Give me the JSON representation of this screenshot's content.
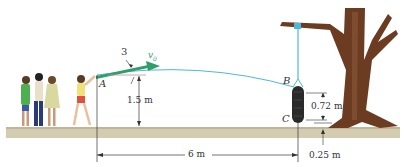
{
  "diagram": {
    "type": "projectile-motion-figure",
    "points": {
      "A": "A",
      "B": "B",
      "C": "C"
    },
    "labels": {
      "angle_slope": "3",
      "velocity": "v",
      "velocity_sub": "0",
      "height_A": "1.5 m",
      "horizontal_distance": "6 m",
      "tire_height": "0.72 m",
      "tire_offset": "0.25 m"
    },
    "colors": {
      "velocity_arrow": "#2e9e6a",
      "trajectory": "#4fb8d8",
      "rope": "#4fb8d8",
      "ground": "#cfc7aa",
      "tree": "#6b3b22",
      "tire": "#2a2a2a",
      "dim_line": "#333333"
    }
  }
}
